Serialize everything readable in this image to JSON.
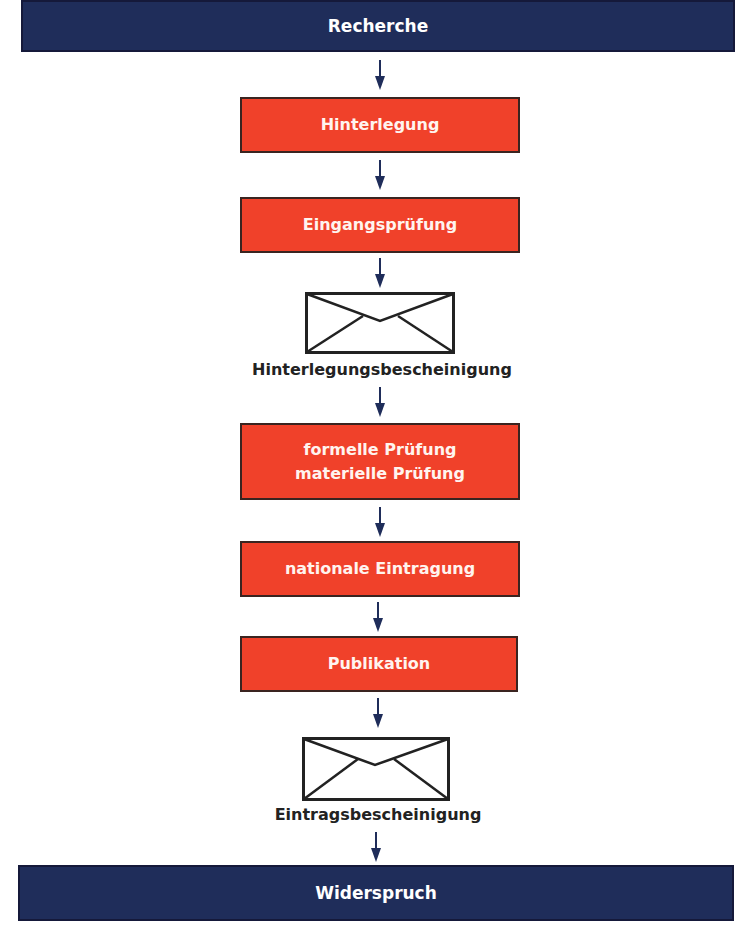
{
  "diagram": {
    "start": {
      "label": "Recherche"
    },
    "steps": [
      {
        "lines": [
          "Hinterlegung"
        ]
      },
      {
        "lines": [
          "Eingangsprüfung"
        ]
      },
      {
        "type": "envelope",
        "label": "Hinterlegungsbescheinigung"
      },
      {
        "lines": [
          "formelle Prüfung",
          "materielle Prüfung"
        ]
      },
      {
        "lines": [
          "nationale Eintragung"
        ]
      },
      {
        "lines": [
          "Publikation"
        ]
      },
      {
        "type": "envelope",
        "label": "Eintragsbescheinigung"
      }
    ],
    "end": {
      "label": "Widerspruch"
    },
    "colors": {
      "navy": "#1f2d5a",
      "red": "#f0412a",
      "arrow": "#1f2d5a"
    }
  }
}
